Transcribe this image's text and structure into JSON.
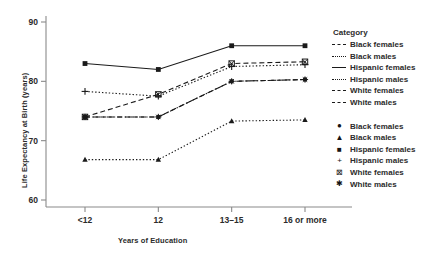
{
  "chart_data": {
    "type": "line",
    "title": "",
    "xlabel": "Years of Education",
    "ylabel": "Life Expectancy at Birth (years)",
    "categories": [
      "<12",
      "12",
      "13–15",
      "16 or more"
    ],
    "ylim": [
      58,
      91
    ],
    "yticks": [
      60,
      70,
      80,
      90
    ],
    "ytick_labels": [
      "60",
      "70",
      "80",
      "90"
    ],
    "grid": false,
    "legend_position": "right",
    "legend_title": "Category",
    "series": [
      {
        "name": "Black females",
        "values": [
          74.0,
          74.0,
          80.0,
          80.3
        ],
        "marker": "circle",
        "dash": "dashed",
        "color": "#1a1a1a"
      },
      {
        "name": "Black males",
        "values": [
          66.8,
          66.8,
          73.3,
          73.5
        ],
        "marker": "triangle",
        "dash": "dotted",
        "color": "#1a1a1a"
      },
      {
        "name": "Hispanic females",
        "values": [
          83.0,
          82.0,
          86.0,
          86.0
        ],
        "marker": "square",
        "dash": "solid",
        "color": "#1a1a1a"
      },
      {
        "name": "Hispanic males",
        "values": [
          78.3,
          77.5,
          82.5,
          82.8
        ],
        "marker": "plus",
        "dash": "dotted",
        "color": "#1a1a1a"
      },
      {
        "name": "White females",
        "values": [
          74.0,
          77.8,
          83.0,
          83.3
        ],
        "marker": "boxed-x",
        "dash": "dashed",
        "color": "#1a1a1a"
      },
      {
        "name": "White males",
        "values": [
          74.0,
          74.0,
          80.0,
          80.3
        ],
        "marker": "asterisk",
        "dash": "dashdot",
        "color": "#1a1a1a"
      }
    ]
  },
  "legend_lines": {
    "title": "Category",
    "items": [
      {
        "label": "Black females",
        "key": "dashed"
      },
      {
        "label": "Black males",
        "key": "dotted"
      },
      {
        "label": "Hispanic females",
        "key": "solid"
      },
      {
        "label": "Hispanic males",
        "key": "dotted"
      },
      {
        "label": "White females",
        "key": "dashed"
      },
      {
        "label": "White males",
        "key": "dashdot"
      }
    ]
  },
  "legend_markers": {
    "items": [
      {
        "label": "Black females",
        "glyph": "●"
      },
      {
        "label": "Black males",
        "glyph": "▲"
      },
      {
        "label": "Hispanic females",
        "glyph": "■"
      },
      {
        "label": "Hispanic males",
        "glyph": "+"
      },
      {
        "label": "White females",
        "glyph": "⊠"
      },
      {
        "label": "White males",
        "glyph": "✱"
      }
    ]
  },
  "axis": {
    "y_tick_labels": [
      "90",
      "80",
      "70",
      "60"
    ],
    "x_tick_labels": [
      "<12",
      "12",
      "13–15",
      "16 or more"
    ]
  },
  "colors": {
    "ink": "#1a1a1a",
    "axis": "#8a8a8a",
    "text": "#2b2b2b",
    "background": "#ffffff"
  }
}
